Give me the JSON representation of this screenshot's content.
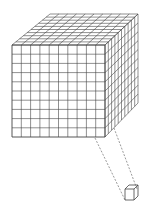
{
  "diagram": {
    "title": "",
    "colors": {
      "background": "#ffffff",
      "stroke": "#444444",
      "dash": "#555555"
    },
    "large_cube": {
      "divisions": 10,
      "front": {
        "x0": 12,
        "y0": 45,
        "x1": 105,
        "y1": 137
      },
      "top_back_left": {
        "x": 50,
        "y": 14
      },
      "top_back_right": {
        "x": 138,
        "y": 14
      },
      "right_back_bottom": {
        "x": 138,
        "y": 103
      },
      "right_front_bottom_corner": {
        "x": 105,
        "y": 137
      }
    },
    "projection_lines": [
      {
        "from": {
          "x": 95,
          "y": 138
        },
        "to": {
          "x": 125,
          "y": 200
        }
      },
      {
        "from": {
          "x": 114,
          "y": 128
        },
        "to": {
          "x": 137,
          "y": 189
        }
      }
    ],
    "unit_cube": {
      "x0": 125,
      "y0": 189,
      "x1": 134,
      "y1": 200,
      "dx": 4,
      "dy": -4
    }
  }
}
